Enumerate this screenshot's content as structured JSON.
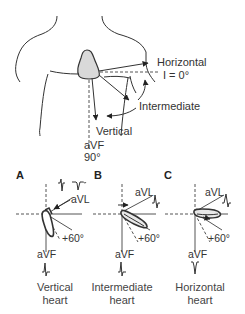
{
  "figure": {
    "title_region": "Heart position and electrical axis on the chest",
    "top": {
      "labels": {
        "horizontal": "Horizontal",
        "lead_i": "I = 0°",
        "intermediate": "Intermediate",
        "vertical": "Vertical",
        "avf": "aVF",
        "avf_angle": "90°"
      }
    },
    "panels": [
      {
        "letter": "A",
        "avl": "aVL",
        "plus60": "+60°",
        "avf": "aVF",
        "caption_line1": "Vertical",
        "caption_line2": "heart"
      },
      {
        "letter": "B",
        "avl": "aVL",
        "plus60": "+60°",
        "avf": "aVF",
        "caption_line1": "Intermediate",
        "caption_line2": "heart"
      },
      {
        "letter": "C",
        "avl": "aVL",
        "plus60": "+60°",
        "avf": "aVF",
        "caption_line1": "Horizontal",
        "caption_line2": "heart"
      }
    ],
    "colors": {
      "line": "#333333",
      "heart_fill": "#d9d9d9",
      "background": "#ffffff"
    }
  }
}
